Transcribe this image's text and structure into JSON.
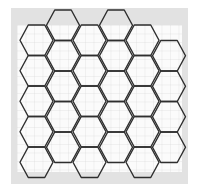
{
  "diagram": {
    "type": "hexagonal-grid",
    "orientation": "flat-top",
    "colors": {
      "background": "#ffffff",
      "frame": "#e2e2e2",
      "paper": "#fbfbfb",
      "grid_line": "#d6d6d6",
      "hex_stroke": "#2e2e2e"
    },
    "frame": {
      "x": 11,
      "y": 8,
      "width": 177,
      "height": 176
    },
    "paper": {
      "x": 17,
      "y": 25,
      "width": 165,
      "height": 147
    },
    "grid_spacing": 8.5,
    "hex": {
      "width": 33,
      "height": 30.5,
      "column_pitch": 26.5
    },
    "columns": [
      {
        "left_x": 20,
        "first_top_y": 25,
        "count": 5
      },
      {
        "left_x": 46.5,
        "first_top_y": 10,
        "count": 5
      },
      {
        "left_x": 73,
        "first_top_y": 25,
        "count": 5
      },
      {
        "left_x": 99.5,
        "first_top_y": 10,
        "count": 5
      },
      {
        "left_x": 126,
        "first_top_y": 25,
        "count": 5
      },
      {
        "left_x": 152.5,
        "first_top_y": 40.5,
        "count": 4
      }
    ],
    "total_hexagons": 29
  }
}
